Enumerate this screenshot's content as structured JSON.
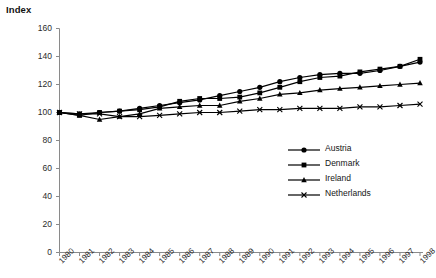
{
  "chart_data": {
    "type": "line",
    "title": "Index",
    "xlabel": "",
    "ylabel": "Index",
    "ylim": [
      0,
      160
    ],
    "yticks": [
      0,
      20,
      40,
      60,
      80,
      100,
      120,
      140,
      160
    ],
    "grid": false,
    "legend_position": "middle-right",
    "categories": [
      "1980",
      "1981",
      "1982",
      "1983",
      "1984",
      "1985",
      "1986",
      "1987",
      "1988",
      "1989",
      "1990",
      "1991",
      "1992",
      "1993",
      "1994",
      "1995",
      "1996",
      "1997",
      "1998"
    ],
    "series": [
      {
        "name": "Austria",
        "marker": "circle",
        "color": "#000000",
        "values": [
          100,
          99,
          100,
          101,
          103,
          105,
          107,
          109,
          112,
          115,
          118,
          122,
          125,
          127,
          128,
          128,
          130,
          133,
          136
        ]
      },
      {
        "name": "Denmark",
        "marker": "square",
        "color": "#000000",
        "values": [
          100,
          98,
          100,
          101,
          102,
          104,
          108,
          110,
          110,
          111,
          114,
          118,
          122,
          125,
          126,
          129,
          131,
          133,
          138
        ]
      },
      {
        "name": "Ireland",
        "marker": "triangle",
        "color": "#000000",
        "values": [
          100,
          98,
          95,
          97,
          99,
          103,
          104,
          105,
          105,
          108,
          110,
          113,
          114,
          116,
          117,
          118,
          119,
          120,
          121
        ]
      },
      {
        "name": "Netherlands",
        "marker": "cross",
        "color": "#000000",
        "values": [
          100,
          99,
          99,
          97,
          97,
          98,
          99,
          100,
          100,
          101,
          102,
          102,
          103,
          103,
          103,
          104,
          104,
          105,
          106
        ]
      }
    ]
  },
  "legend": {
    "items": [
      {
        "label": "Austria"
      },
      {
        "label": "Denmark"
      },
      {
        "label": "Ireland"
      },
      {
        "label": "Netherlands"
      }
    ]
  }
}
